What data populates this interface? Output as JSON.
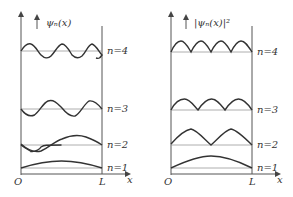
{
  "left_panel": {
    "y_label": "ψₙ(x)",
    "origin_label": "O",
    "end_label": "L",
    "x_axis_label": "x",
    "levels": [
      {
        "label": "n=1",
        "n": 1
      },
      {
        "label": "n=2",
        "n": 2
      },
      {
        "label": "n=3",
        "n": 3
      },
      {
        "label": "n=4",
        "n": 4
      }
    ]
  },
  "right_panel": {
    "y_label": "|ψₙ(x)|²",
    "origin_label": "O",
    "end_label": "L",
    "x_axis_label": "x",
    "levels": [
      {
        "label": "n=1",
        "n": 1
      },
      {
        "label": "n=2",
        "n": 2
      },
      {
        "label": "n=3",
        "n": 3
      },
      {
        "label": "n=4",
        "n": 4
      }
    ]
  },
  "colors": {
    "curve": "#333333",
    "axis": "#555555",
    "baseline": "#999999"
  }
}
